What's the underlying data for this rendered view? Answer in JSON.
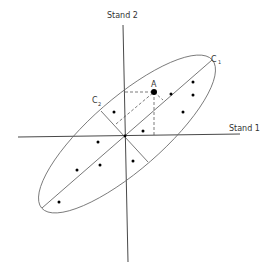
{
  "diagram": {
    "axes": {
      "x_label": "Stand 1",
      "y_label": "Stand 2"
    },
    "components": {
      "c1_label": "C",
      "c1_sub": "1",
      "c2_label": "C",
      "c2_sub": "2"
    },
    "point_label": "A",
    "points": [
      {
        "x": 193,
        "y": 82
      },
      {
        "x": 193,
        "y": 95
      },
      {
        "x": 171,
        "y": 94
      },
      {
        "x": 183,
        "y": 112
      },
      {
        "x": 143,
        "y": 131
      },
      {
        "x": 114,
        "y": 112
      },
      {
        "x": 98,
        "y": 142
      },
      {
        "x": 77,
        "y": 170
      },
      {
        "x": 100,
        "y": 165
      },
      {
        "x": 133,
        "y": 161
      },
      {
        "x": 59,
        "y": 202
      }
    ],
    "colors": {
      "line": "#333333",
      "ellipse": "#666666",
      "dot": "#000000"
    }
  }
}
